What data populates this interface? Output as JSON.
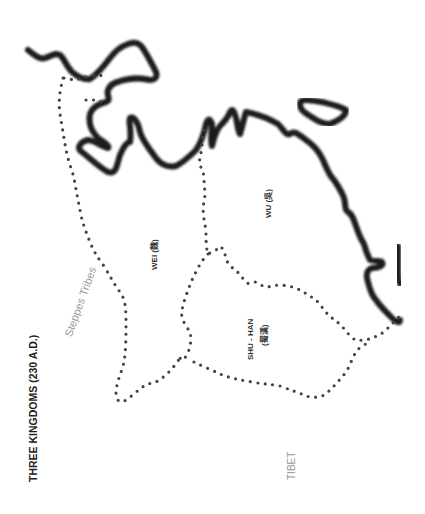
{
  "map": {
    "title": "THREE KINGDOMS (230 A.D.)",
    "kingdoms": [
      {
        "name": "WEI (魏)",
        "key": "wei"
      },
      {
        "name": "WU (吳)",
        "key": "wu"
      },
      {
        "name": "SHU - HAN",
        "sub": "(蜀漢)",
        "key": "shu-han"
      }
    ],
    "regions": [
      {
        "name": "Steppes Tribes"
      },
      {
        "name": "TIBET"
      }
    ],
    "colors": {
      "coastline": "#1a1a1a",
      "border": "#444444",
      "title": "#222222",
      "region_label": "#999999",
      "background": "#ffffff"
    }
  }
}
